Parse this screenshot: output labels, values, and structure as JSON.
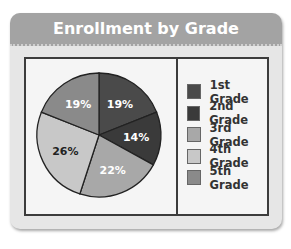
{
  "title": "Enrollment by Grade",
  "chart_data": {
    "type": "pie",
    "title": "Enrollment by Grade",
    "categories": [
      "1st Grade",
      "2nd Grade",
      "3rd Grade",
      "4th Grade",
      "5th Grade"
    ],
    "values": [
      19,
      14,
      22,
      26,
      19
    ],
    "labels": [
      "19%",
      "14%",
      "22%",
      "26%",
      "19%"
    ],
    "colors": [
      "#4a4a4a",
      "#3a3a3a",
      "#a8a8a8",
      "#c8c8c8",
      "#8a8a8a"
    ],
    "legend_position": "right"
  },
  "legend": {
    "items": [
      {
        "label": "1st Grade",
        "color": "#4a4a4a"
      },
      {
        "label": "2nd Grade",
        "color": "#3a3a3a"
      },
      {
        "label": "3rd Grade",
        "color": "#a8a8a8"
      },
      {
        "label": "4th Grade",
        "color": "#c8c8c8"
      },
      {
        "label": "5th Grade",
        "color": "#8a8a8a"
      }
    ]
  }
}
